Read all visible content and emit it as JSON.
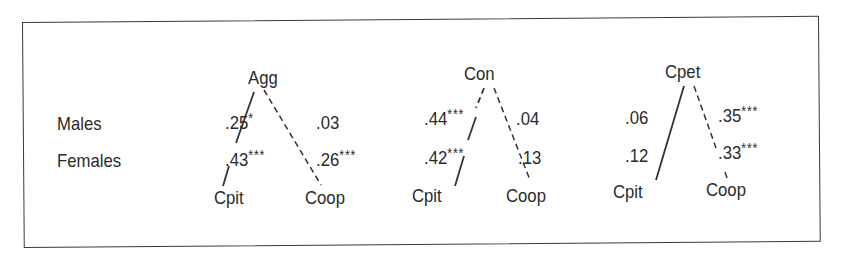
{
  "row_labels": {
    "males": "Males",
    "females": "Females"
  },
  "diagrams": [
    {
      "top": "Agg",
      "left_node": "Cpit",
      "right_node": "Coop",
      "males_left": ".25",
      "males_left_sig": "*",
      "males_right": ".03",
      "males_right_sig": "",
      "females_left": ".43",
      "females_left_sig": "***",
      "females_right": ".26",
      "females_right_sig": "***"
    },
    {
      "top": "Con",
      "left_node": "Cpit",
      "right_node": "Coop",
      "males_left": ".44",
      "males_left_sig": "***",
      "males_right": ".04",
      "males_right_sig": "",
      "females_left": ".42",
      "females_left_sig": "***",
      "females_right": ".13",
      "females_right_sig": ""
    },
    {
      "top": "Cpet",
      "left_node": "Cpit",
      "right_node": "Coop",
      "males_left": ".06",
      "males_left_sig": "",
      "males_right": ".35",
      "males_right_sig": "***",
      "females_left": ".12",
      "females_left_sig": "",
      "females_right": ".33",
      "females_right_sig": "***"
    }
  ]
}
